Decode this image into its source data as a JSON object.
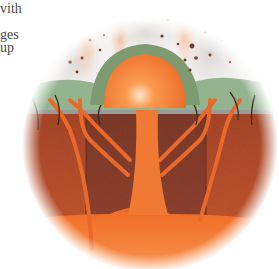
{
  "text_fragments": {
    "lines": [
      "vith",
      "",
      "ges",
      "up"
    ]
  },
  "illustration": {
    "subject": "volcanic lava dome cross-section",
    "labels": [],
    "colors": {
      "sky_smoke": "#e8e4e0",
      "vegetation": "#8fb08a",
      "ground_rock": "#b5502e",
      "ground_rock_dark": "#8a3e2a",
      "magma": "#f07028",
      "magma_highlight": "#ffd0a0",
      "magma_chamber": "#f3823a"
    }
  }
}
